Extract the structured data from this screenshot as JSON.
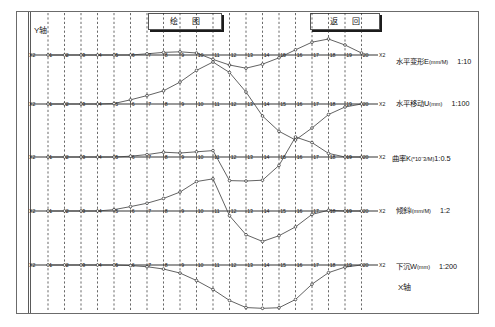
{
  "window": {
    "title": "绘图",
    "background": "#ffffff",
    "frame_color": "#6b6b6b"
  },
  "toolbar": {
    "draw_label": "绘 图",
    "back_label": "返 回"
  },
  "axes": {
    "y_axis_label": "Y轴",
    "x_axis_label": "X轴",
    "row_end_tag": "X2",
    "row_start_tag": "X2"
  },
  "legend": [
    {
      "name": "水平变形E",
      "unit": "(mm/M)",
      "scale": "1:10"
    },
    {
      "name": "水平移动U",
      "unit": "(mm)",
      "scale": "1:100"
    },
    {
      "name": "曲率K",
      "unit": "(*10ˉ3/M)",
      "scale": "1:0.5"
    },
    {
      "name": "倾斜i",
      "unit": "(mm/M)",
      "scale": "1:2"
    },
    {
      "name": "下沉W",
      "unit": "(mm)",
      "scale": "1:200"
    }
  ],
  "chart_data": {
    "type": "line",
    "xlabel": "X轴",
    "ylabel": "Y轴",
    "grid": true,
    "legend_position": "right",
    "x_tick_labels": [
      "1",
      "2",
      "3",
      "4",
      "5",
      "6",
      "7",
      "8",
      "9",
      "10",
      "11",
      "12",
      "13",
      "14",
      "15",
      "16",
      "17",
      "18",
      "19",
      "20"
    ],
    "xlim": [
      0,
      21
    ],
    "panels": [
      {
        "id": "horizontal-deformation",
        "name": "水平变形E",
        "unit": "(mm/M)",
        "scale": "1:10",
        "baseline_y": 55,
        "ylim": [
          -22,
          22
        ],
        "x": [
          1,
          2,
          3,
          4,
          5,
          6,
          7,
          8,
          9,
          10,
          11,
          12,
          13,
          14,
          15,
          16,
          17,
          18,
          19,
          20
        ],
        "values": [
          0,
          0,
          0,
          0,
          0,
          0,
          0.6,
          1.3,
          1.6,
          1.0,
          -2.2,
          -5.0,
          -6.6,
          -4.6,
          -1.4,
          2.6,
          6.4,
          8.0,
          5.0,
          1.0
        ]
      },
      {
        "id": "horizontal-movement",
        "name": "水平移动U",
        "unit": "(mm)",
        "scale": "1:100",
        "baseline_y": 104,
        "ylim": [
          -30,
          40
        ],
        "x": [
          1,
          2,
          3,
          4,
          5,
          6,
          7,
          8,
          9,
          10,
          11,
          12,
          13,
          14,
          15,
          16,
          17,
          18,
          19,
          20
        ],
        "values": [
          0,
          0,
          0,
          0,
          0.3,
          2.8,
          5.6,
          8.8,
          14.6,
          22.4,
          28.0,
          21.0,
          8.0,
          -8.0,
          -18.2,
          -24.0,
          -16.0,
          -7.0,
          -2.0,
          0
        ]
      },
      {
        "id": "curvature",
        "name": "曲率K",
        "unit": "(*10ˉ3/M)",
        "scale": "1:0.5",
        "baseline_y": 157,
        "ylim": [
          -22,
          22
        ],
        "x": [
          1,
          2,
          3,
          4,
          5,
          6,
          7,
          8,
          9,
          10,
          11,
          12,
          13,
          14,
          15,
          16,
          17,
          18,
          19,
          20
        ],
        "values": [
          0,
          0,
          0,
          0,
          0,
          0.4,
          1.2,
          2.4,
          2.0,
          2.6,
          3.2,
          -11.8,
          -12.0,
          -11.6,
          -4.2,
          10.0,
          7.2,
          1.8,
          0,
          0
        ]
      },
      {
        "id": "tilt",
        "name": "倾斜i",
        "unit": "(mm/M)",
        "scale": "1:2",
        "baseline_y": 211,
        "ylim": [
          -26,
          26
        ],
        "x": [
          1,
          2,
          3,
          4,
          5,
          6,
          7,
          8,
          9,
          10,
          11,
          12,
          13,
          14,
          15,
          16,
          17,
          18,
          19,
          20
        ],
        "values": [
          0,
          0,
          0,
          0,
          0.8,
          2.6,
          4.6,
          7.4,
          11.2,
          17.4,
          19.0,
          -2.8,
          -14.0,
          -18.0,
          -14.6,
          -9.4,
          -2.0,
          0.4,
          0,
          0
        ]
      },
      {
        "id": "subsidence",
        "name": "下沉W",
        "unit": "(mm)",
        "scale": "1:200",
        "baseline_y": 265,
        "ylim": [
          -48,
          8
        ],
        "x": [
          1,
          2,
          3,
          4,
          5,
          6,
          7,
          8,
          9,
          10,
          11,
          12,
          13,
          14,
          15,
          16,
          17,
          18,
          19,
          20
        ],
        "values": [
          0,
          0,
          0,
          0,
          0,
          -0.6,
          -1.8,
          -4.2,
          -8.4,
          -16.2,
          -25.6,
          -37.0,
          -44.4,
          -45.2,
          -44.6,
          -36.0,
          -20.0,
          -8.0,
          -2.2,
          0
        ]
      }
    ]
  }
}
